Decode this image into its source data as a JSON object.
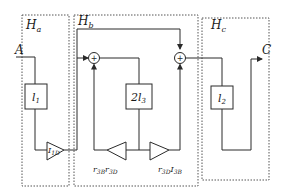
{
  "diagram": {
    "groups": [
      {
        "id": "Ha",
        "label": "H",
        "sub": "a"
      },
      {
        "id": "Hb",
        "label": "H",
        "sub": "b"
      },
      {
        "id": "Hc",
        "label": "H",
        "sub": "c"
      }
    ],
    "ports": {
      "input": "A",
      "output": "C"
    },
    "blocks": {
      "l1": {
        "label": "l",
        "sub": "1"
      },
      "l3": {
        "label": "2l",
        "sub": "3"
      },
      "l2": {
        "label": "l",
        "sub": "2"
      }
    },
    "gains": {
      "g1": {
        "label": "I",
        "sub": "1D"
      },
      "g2": {
        "label": "r",
        "sub1": "3B",
        "mid": "r",
        "sub2": "3D"
      },
      "g3": {
        "label": "r",
        "sub1": "3D",
        "mid": "I",
        "sub2": "3B"
      }
    },
    "summers": {
      "s1": {
        "symbol": "+"
      },
      "s2": {
        "symbol": "+"
      }
    },
    "colors": {
      "line": "#2a2a2a",
      "dotted": "#555555"
    }
  }
}
